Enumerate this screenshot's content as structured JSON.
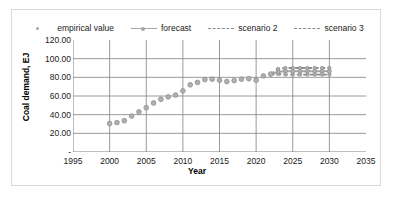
{
  "chart_data": {
    "type": "line",
    "title": "",
    "xlabel": "Year",
    "ylabel": "Coal demand, EJ",
    "xlim": [
      1995,
      2035
    ],
    "ylim": [
      0,
      120
    ],
    "grid": true,
    "legend_position": "top",
    "xticks": [
      "1995",
      "2000",
      "2005",
      "2010",
      "2015",
      "2020",
      "2025",
      "2030",
      "2035"
    ],
    "xtick_values": [
      1995,
      2000,
      2005,
      2010,
      2015,
      2020,
      2025,
      2030,
      2035
    ],
    "yticks": [
      "-",
      "20.00",
      "40.00",
      "60.00",
      "80.00",
      "100.00",
      "120.00"
    ],
    "ytick_values": [
      0,
      20,
      40,
      60,
      80,
      100,
      120
    ],
    "series": [
      {
        "name": "empirical value",
        "style": "markers",
        "color": "#9a9a9a",
        "x": [
          2000,
          2001,
          2002,
          2003,
          2004,
          2005,
          2006,
          2007,
          2008,
          2009,
          2010,
          2011,
          2012,
          2013,
          2014,
          2015,
          2016,
          2017,
          2018,
          2019,
          2020,
          2021,
          2022
        ],
        "values": [
          30.5,
          31.5,
          33.5,
          38.5,
          43.0,
          47.5,
          52.5,
          56.5,
          59.0,
          61.0,
          65.5,
          72.0,
          74.5,
          77.5,
          78.0,
          77.0,
          75.5,
          76.5,
          78.0,
          78.5,
          77.0,
          81.5,
          83.5
        ]
      },
      {
        "name": "forecast",
        "style": "line-markers",
        "color": "#a6a6a6",
        "x": [
          2022,
          2023,
          2024,
          2025,
          2026,
          2027,
          2028,
          2029,
          2030
        ],
        "values": [
          83.5,
          86.0,
          86.5,
          86.5,
          86.5,
          86.5,
          86.5,
          86.5,
          86.5
        ]
      },
      {
        "name": "scenario 2",
        "style": "dashed",
        "color": "#8c8c8c",
        "x": [
          2022,
          2023,
          2024,
          2025,
          2026,
          2027,
          2028,
          2029,
          2030
        ],
        "values": [
          83.5,
          89.0,
          90.0,
          90.0,
          90.0,
          90.0,
          90.0,
          90.0,
          90.0
        ]
      },
      {
        "name": "scenario 3",
        "style": "dashed",
        "color": "#8c8c8c",
        "x": [
          2022,
          2023,
          2024,
          2025,
          2026,
          2027,
          2028,
          2029,
          2030
        ],
        "values": [
          83.5,
          83.5,
          83.0,
          83.0,
          83.0,
          83.0,
          83.0,
          83.0,
          83.0
        ]
      }
    ]
  },
  "legend": {
    "items": [
      {
        "label": "empirical value"
      },
      {
        "label": "forecast"
      },
      {
        "label": "scenario 2"
      },
      {
        "label": "scenario 3"
      }
    ]
  },
  "axes": {
    "ylabel": "Coal demand, EJ",
    "xlabel": "Year"
  }
}
